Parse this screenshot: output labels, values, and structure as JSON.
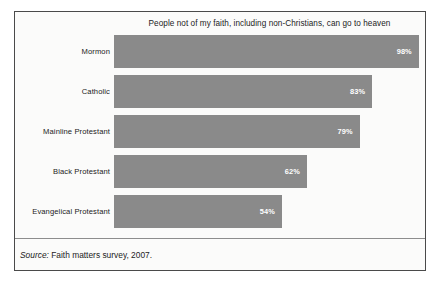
{
  "chart_data": {
    "type": "bar",
    "orientation": "horizontal",
    "title": "People not of my faith, including non-Christians, can go to heaven",
    "xlabel": "",
    "ylabel": "",
    "xlim": [
      0,
      100
    ],
    "grid": false,
    "legend": false,
    "value_suffix": "%",
    "categories": [
      "Mormon",
      "Catholic",
      "Mainline Protestant",
      "Black Protestant",
      "Evangelical Protestant"
    ],
    "values": [
      98,
      83,
      79,
      62,
      54
    ],
    "value_labels": [
      "98%",
      "83%",
      "79%",
      "62%",
      "54%"
    ],
    "bar_color": "#8a8a8a",
    "value_label_color": "#ffffff",
    "background_color": "#fbfbfa",
    "border_color": "#4a4a4a"
  },
  "source": {
    "prefix": "Source:",
    "text": "Faith matters survey, 2007."
  }
}
